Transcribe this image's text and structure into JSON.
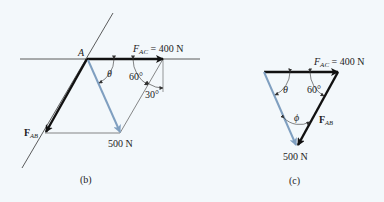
{
  "figure_b": {
    "caption": "(b)",
    "point_label": "A",
    "fac_label": "F",
    "fac_sub": "AC",
    "fac_value": " = 400 N",
    "fab_label": "F",
    "fab_sub": "AB",
    "resultant_label": "500 N",
    "angle_theta": "θ",
    "angle_60": "60°",
    "angle_30": "30°"
  },
  "figure_c": {
    "caption": "(c)",
    "fac_label": "F",
    "fac_sub": "AC",
    "fac_value": " = 400 N",
    "fab_label": "F",
    "fab_sub": "AB",
    "resultant_label": "500 N",
    "angle_theta": "θ",
    "angle_60": "60°",
    "angle_phi": "ϕ"
  },
  "colors": {
    "background": "#f3f8fb",
    "force_black": "#111111",
    "resultant_blue": "#7f9fc0",
    "line_gray": "#333333"
  }
}
